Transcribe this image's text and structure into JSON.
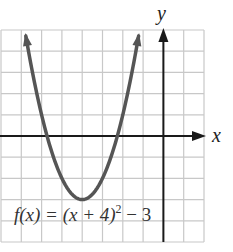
{
  "chart_data": {
    "type": "line",
    "title": "",
    "function": "f(x) = (x + 4)^2 - 3",
    "xlabel": "x",
    "ylabel": "y",
    "xlim": [
      -8,
      2
    ],
    "ylim": [
      -5,
      5
    ],
    "grid": true,
    "grid_step": 1,
    "vertex": [
      -4,
      -3
    ],
    "x_intercepts": [
      -5.732,
      -2.268
    ],
    "series": [
      {
        "name": "f(x) = (x + 4)^2 - 3",
        "x": [
          -6.83,
          -6.5,
          -6,
          -5.5,
          -5,
          -4.5,
          -4,
          -3.5,
          -3,
          -2.5,
          -2,
          -1.5,
          -1.17
        ],
        "y": [
          5,
          3.25,
          1,
          -0.75,
          -2,
          -2.75,
          -3,
          -2.75,
          -2,
          -0.75,
          1,
          3.25,
          5
        ]
      }
    ],
    "annotations": [
      {
        "text": "f(x) = (x + 4)",
        "superscript": "2",
        "suffix": " − 3",
        "position": "bottom-left"
      }
    ]
  },
  "labels": {
    "x_axis": "x",
    "y_axis": "y",
    "eq_main": "f(x) = (x + 4)",
    "eq_sup": "2",
    "eq_tail": " − 3"
  },
  "colors": {
    "grid": "#c8c8c8",
    "axis": "#1a1a1a",
    "curve": "#555555"
  }
}
